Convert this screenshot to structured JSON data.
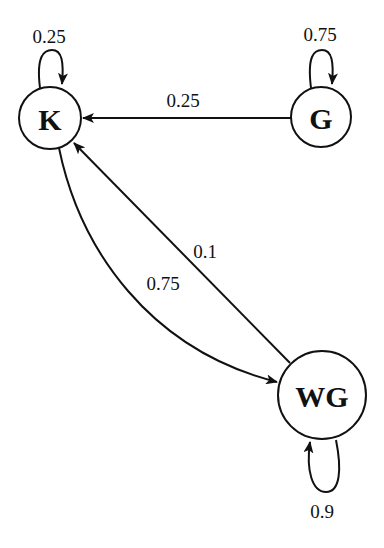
{
  "diagram": {
    "type": "markov-chain",
    "nodes": [
      {
        "id": "K",
        "label": "K"
      },
      {
        "id": "G",
        "label": "G"
      },
      {
        "id": "WG",
        "label": "WG"
      }
    ],
    "edges": [
      {
        "from": "K",
        "to": "K",
        "label": "0.25"
      },
      {
        "from": "G",
        "to": "G",
        "label": "0.75"
      },
      {
        "from": "G",
        "to": "K",
        "label": "0.25"
      },
      {
        "from": "K",
        "to": "WG",
        "label": "0.75"
      },
      {
        "from": "WG",
        "to": "K",
        "label": "0.1"
      },
      {
        "from": "WG",
        "to": "WG",
        "label": "0.9"
      }
    ]
  }
}
